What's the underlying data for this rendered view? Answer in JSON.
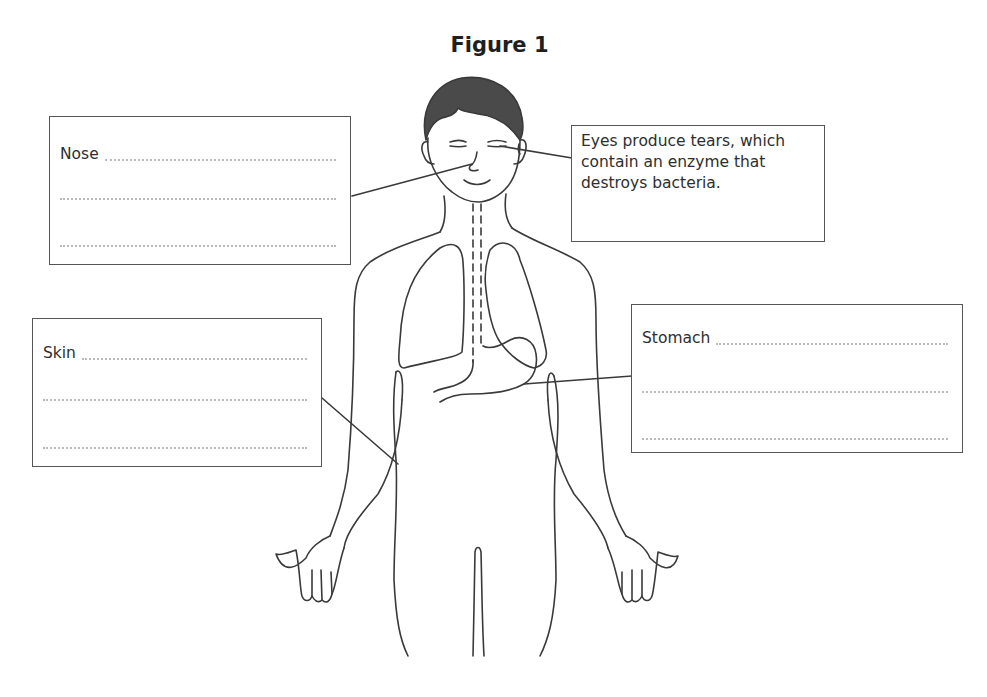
{
  "figure": {
    "title": "Figure 1",
    "colors": {
      "outline": "#3a3a3a",
      "hair": "#4a4a4a",
      "box_border": "#555555",
      "dotted_line": "#b9b9b9"
    }
  },
  "boxes": {
    "nose": {
      "label": "Nose",
      "answer_lines": 3,
      "points_to": "nose"
    },
    "eyes": {
      "text": "Eyes produce tears, which contain an enzyme that destroys bacteria.",
      "points_to": "eye"
    },
    "skin": {
      "label": "Skin",
      "answer_lines": 3,
      "points_to": "skin of abdomen/arm"
    },
    "stomach": {
      "label": "Stomach",
      "answer_lines": 3,
      "points_to": "stomach"
    }
  }
}
